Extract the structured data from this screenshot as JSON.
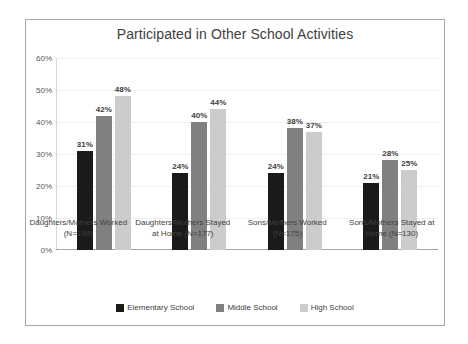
{
  "chart_data": {
    "type": "bar",
    "title": "Participated in Other School Activities",
    "xlabel": "",
    "ylabel": "",
    "ylim": [
      0,
      60
    ],
    "ytick_labels": [
      "60%",
      "50%",
      "40%",
      "30%",
      "20%",
      "10%",
      "0%"
    ],
    "ytick_values": [
      60,
      50,
      40,
      30,
      20,
      10,
      0
    ],
    "grid": true,
    "legend_position": "bottom",
    "categories": [
      "Daughters/Mothers Worked (N=199)",
      "Daughters/Mothers Stayed at Home (N=177)",
      "Sons/Mothers Worked (N=175)",
      "Sons/Mothers Stayed at Home (N=130)"
    ],
    "series": [
      {
        "name": "Elementary School",
        "color": "#1a1a1a",
        "values": [
          31,
          24,
          24,
          21
        ],
        "labels": [
          "31%",
          "24%",
          "24%",
          "21%"
        ]
      },
      {
        "name": "Middle School",
        "color": "#808080",
        "values": [
          42,
          40,
          38,
          28
        ],
        "labels": [
          "42%",
          "40%",
          "38%",
          "28%"
        ]
      },
      {
        "name": "High School",
        "color": "#cccccc",
        "values": [
          48,
          44,
          37,
          25
        ],
        "labels": [
          "48%",
          "44%",
          "37%",
          "25%"
        ]
      }
    ]
  }
}
